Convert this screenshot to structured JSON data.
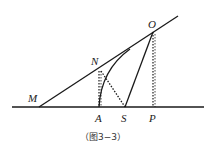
{
  "figure": {
    "caption": "（图3−3）",
    "points": {
      "M": "M",
      "N": "N",
      "O": "O",
      "A": "A",
      "S": "S",
      "P": "P"
    },
    "colors": {
      "line": "#1a1a1a",
      "background": "#ffffff"
    }
  }
}
